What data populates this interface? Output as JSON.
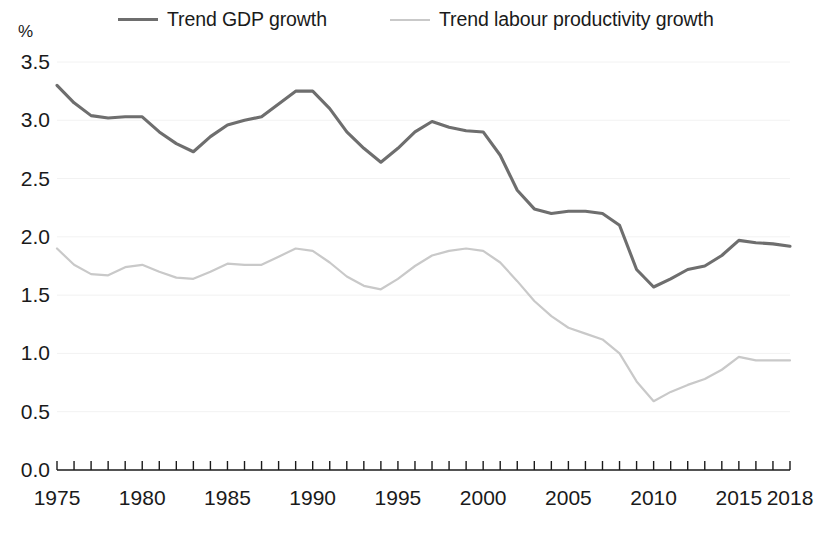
{
  "legend": {
    "entries": [
      {
        "key": "gdp",
        "label": "Trend GDP growth",
        "color": "#6e6e6e"
      },
      {
        "key": "prod",
        "label": "Trend labour productivity growth",
        "color": "#c9c9c9"
      }
    ]
  },
  "axes": {
    "unit_label": "%",
    "y_ticks": [
      "3.5",
      "3.0",
      "2.5",
      "2.0",
      "1.5",
      "1.0",
      "0.5",
      "0.0"
    ],
    "x_ticks": [
      "1975",
      "1980",
      "1985",
      "1990",
      "1995",
      "2000",
      "2005",
      "2010",
      "2015",
      "2018"
    ]
  },
  "chart_data": {
    "type": "line",
    "title": "",
    "subtitle": "",
    "xlabel": "",
    "ylabel": "%",
    "xlim": [
      1975,
      2018
    ],
    "ylim": [
      0.0,
      3.5
    ],
    "grid": false,
    "legend_position": "top",
    "x": [
      1975,
      1976,
      1977,
      1978,
      1979,
      1980,
      1981,
      1982,
      1983,
      1984,
      1985,
      1986,
      1987,
      1988,
      1989,
      1990,
      1991,
      1992,
      1993,
      1994,
      1995,
      1996,
      1997,
      1998,
      1999,
      2000,
      2001,
      2002,
      2003,
      2004,
      2005,
      2006,
      2007,
      2008,
      2009,
      2010,
      2011,
      2012,
      2013,
      2014,
      2015,
      2016,
      2017,
      2018
    ],
    "series": [
      {
        "name": "Trend GDP growth",
        "color": "#6e6e6e",
        "linestyle": "solid",
        "values": [
          3.3,
          3.15,
          3.04,
          3.02,
          3.03,
          3.03,
          2.9,
          2.8,
          2.73,
          2.86,
          2.96,
          3.0,
          3.03,
          3.14,
          3.25,
          3.25,
          3.1,
          2.9,
          2.76,
          2.64,
          2.76,
          2.9,
          2.99,
          2.94,
          2.91,
          2.9,
          2.7,
          2.4,
          2.24,
          2.2,
          2.22,
          2.22,
          2.2,
          2.1,
          1.72,
          1.57,
          1.64,
          1.72,
          1.75,
          1.84,
          1.97,
          1.95,
          1.94,
          1.92
        ]
      },
      {
        "name": "Trend labour productivity growth",
        "color": "#c9c9c9",
        "linestyle": "solid",
        "values": [
          1.9,
          1.76,
          1.68,
          1.67,
          1.74,
          1.76,
          1.7,
          1.65,
          1.64,
          1.7,
          1.77,
          1.76,
          1.76,
          1.83,
          1.9,
          1.88,
          1.78,
          1.66,
          1.58,
          1.55,
          1.64,
          1.75,
          1.84,
          1.88,
          1.9,
          1.88,
          1.78,
          1.62,
          1.45,
          1.32,
          1.22,
          1.17,
          1.12,
          1.0,
          0.76,
          0.59,
          0.67,
          0.73,
          0.78,
          0.86,
          0.97,
          0.94,
          0.94,
          0.94
        ]
      }
    ]
  }
}
